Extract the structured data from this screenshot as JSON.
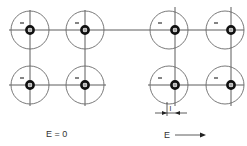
{
  "diagram": {
    "title": "",
    "panels": [
      {
        "name": "unpolarized",
        "label": "E = 0",
        "atoms": [
          {
            "shell_center": [
              30,
              30
            ],
            "nucleus": [
              30,
              30
            ]
          },
          {
            "shell_center": [
              85,
              30
            ],
            "nucleus": [
              85,
              30
            ]
          },
          {
            "shell_center": [
              30,
              85
            ],
            "nucleus": [
              30,
              85
            ]
          },
          {
            "shell_center": [
              85,
              85
            ],
            "nucleus": [
              85,
              85
            ]
          }
        ]
      },
      {
        "name": "polarized",
        "label": "E",
        "displacement_label": "l",
        "atoms": [
          {
            "shell_center": [
              169,
              30
            ],
            "nucleus": [
              175,
              30
            ]
          },
          {
            "shell_center": [
              225,
              30
            ],
            "nucleus": [
              231,
              30
            ]
          },
          {
            "shell_center": [
              169,
              85
            ],
            "nucleus": [
              175,
              85
            ]
          },
          {
            "shell_center": [
              225,
              85
            ],
            "nucleus": [
              231,
              85
            ]
          }
        ]
      }
    ],
    "symbols": {
      "electron_cloud_charge": "−",
      "nucleus_charge": "+"
    }
  }
}
